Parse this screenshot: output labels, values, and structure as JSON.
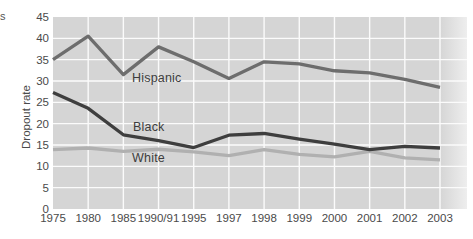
{
  "page": {
    "stray_fragment": "s"
  },
  "chart_data": {
    "type": "line",
    "ylabel": "Dropout rate",
    "xlabel": "",
    "ylim": [
      0,
      45
    ],
    "yticks": [
      0,
      5,
      10,
      15,
      20,
      25,
      30,
      35,
      40,
      45
    ],
    "grid": "on",
    "legend_position": "inline-labels",
    "categories": [
      "1975",
      "1980",
      "1985",
      "1990/91",
      "1995",
      "1997",
      "1998",
      "1999",
      "2000",
      "2001",
      "2002",
      "2003"
    ],
    "series": [
      {
        "name": "Hispanic",
        "color": "#6d6d6d",
        "values": [
          35.0,
          40.5,
          31.5,
          38.0,
          34.5,
          30.6,
          34.5,
          34.0,
          32.4,
          31.9,
          30.4,
          28.5
        ]
      },
      {
        "name": "Black",
        "color": "#3e3e3e",
        "values": [
          27.3,
          23.6,
          17.4,
          16.0,
          14.4,
          17.3,
          17.7,
          16.4,
          15.2,
          13.9,
          14.7,
          14.3
        ]
      },
      {
        "name": "White",
        "color": "#b0b0b0",
        "values": [
          13.9,
          14.3,
          13.5,
          14.0,
          13.4,
          12.5,
          13.9,
          12.8,
          12.2,
          13.5,
          12.0,
          11.5
        ]
      }
    ],
    "style": {
      "plot_bg": "#d5d5d5",
      "plot_bg_right_fade": "#eeeeee",
      "gridline_color": "#fbfbfb",
      "tick_text_color": "#4a4a4a"
    }
  }
}
